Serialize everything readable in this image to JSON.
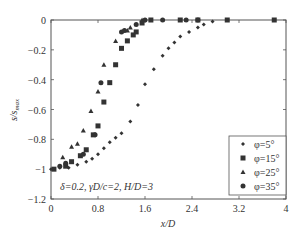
{
  "chart_data": {
    "type": "scatter",
    "title": "",
    "xlabel": "x/D",
    "ylabel": "s/s_max",
    "xlim": [
      0,
      4
    ],
    "ylim": [
      -1.2,
      0
    ],
    "xticks": [
      0,
      0.8,
      1.6,
      2.4,
      3.2,
      4
    ],
    "xtick_labels": [
      "0",
      "0.8",
      "1.6",
      "2.4",
      "3.2",
      "4"
    ],
    "yticks": [
      0,
      -0.2,
      -0.4,
      -0.6,
      -0.8,
      -1,
      -1.2
    ],
    "ytick_labels": [
      "0",
      "−0.2",
      "−0.4",
      "−0.6",
      "−0.8",
      "−1",
      "−1.2"
    ],
    "grid": false,
    "legend_position": "lower right",
    "annotation": "δ=0.2, γD/c=2, H/D=3",
    "series": [
      {
        "name": "φ=5°",
        "marker": "diamond",
        "x": [
          0.0,
          0.15,
          0.3,
          0.45,
          0.6,
          0.7,
          0.8,
          0.9,
          1.0,
          1.1,
          1.2,
          1.35,
          1.48,
          1.6,
          1.75,
          1.9,
          2.0,
          2.1,
          2.2,
          2.35,
          2.5,
          2.6,
          2.75
        ],
        "y": [
          -1.0,
          -0.99,
          -0.99,
          -0.97,
          -0.95,
          -0.93,
          -0.9,
          -0.86,
          -0.82,
          -0.79,
          -0.76,
          -0.68,
          -0.57,
          -0.43,
          -0.33,
          -0.24,
          -0.19,
          -0.15,
          -0.11,
          -0.08,
          -0.05,
          -0.03,
          -0.01
        ]
      },
      {
        "name": "φ=15°",
        "marker": "square",
        "x": [
          0.05,
          0.25,
          0.35,
          0.5,
          0.6,
          0.72,
          0.8,
          0.9,
          1.0,
          1.1,
          1.2,
          1.3,
          1.4,
          1.45,
          1.55,
          1.7,
          2.2,
          2.5,
          3.0,
          3.8
        ],
        "y": [
          -1.0,
          -0.98,
          -0.95,
          -0.91,
          -0.87,
          -0.77,
          -0.71,
          -0.55,
          -0.42,
          -0.3,
          -0.19,
          -0.14,
          -0.1,
          -0.08,
          -0.02,
          0.0,
          0.0,
          0.0,
          0.0,
          0.0
        ]
      },
      {
        "name": "φ=25°",
        "marker": "triangle",
        "x": [
          0.2,
          0.35,
          0.45,
          0.55,
          0.68,
          0.8,
          0.9,
          1.1,
          1.3,
          1.35,
          1.55
        ],
        "y": [
          -0.92,
          -0.85,
          -0.83,
          -0.74,
          -0.61,
          -0.48,
          -0.3,
          -0.14,
          -0.07,
          -0.05,
          0.0
        ]
      },
      {
        "name": "φ=35°",
        "marker": "circle",
        "x": [
          0.15,
          0.25,
          0.55,
          0.75,
          0.85,
          1.2,
          1.25,
          1.45,
          1.6,
          1.9,
          2.3,
          2.5
        ],
        "y": [
          -0.98,
          -0.96,
          -0.9,
          -0.77,
          -0.42,
          -0.08,
          -0.07,
          -0.03,
          0.0,
          0.0,
          0.0,
          0.0
        ]
      }
    ]
  },
  "legend": {
    "items": [
      {
        "label": "φ=5°",
        "marker": "diamond"
      },
      {
        "label": "φ=15°",
        "marker": "square"
      },
      {
        "label": "φ=25°",
        "marker": "triangle"
      },
      {
        "label": "φ=35°",
        "marker": "circle"
      }
    ]
  },
  "labels": {
    "xlabel": "x/D",
    "ylabel": "s/s",
    "ylabel_sub": "max",
    "annotation": "δ=0.2, γD/c=2, H/D=3"
  },
  "colors": {
    "axis": "#555555",
    "marker": "#333333",
    "text": "#333333"
  }
}
